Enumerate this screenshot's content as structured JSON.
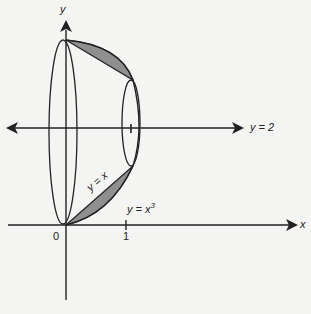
{
  "diagram": {
    "type": "solid of revolution",
    "axes": {
      "x_label": "x",
      "y_label": "y"
    },
    "axis_of_rotation": {
      "label": "y = 2"
    },
    "curves": [
      {
        "name": "line",
        "label": "y = x"
      },
      {
        "name": "cubic",
        "label": "y = x",
        "superscript": "3"
      }
    ],
    "ticks": {
      "origin": "0",
      "x_one": "1"
    },
    "colors": {
      "shaded_region": "#8f8f8f",
      "stroke": "#222222",
      "background": "#f4f4f2"
    }
  }
}
